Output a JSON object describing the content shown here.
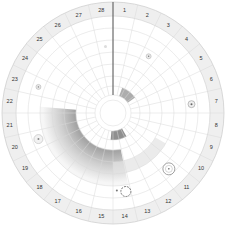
{
  "diagram": {
    "type": "circular-cycle-wheel",
    "segments": 28,
    "day_labels": [
      "1",
      "2",
      "3",
      "4",
      "5",
      "6",
      "7",
      "8",
      "9",
      "10",
      "11",
      "12",
      "13",
      "14",
      "15",
      "16",
      "17",
      "18",
      "19",
      "20",
      "21",
      "22",
      "23",
      "24",
      "25",
      "26",
      "27",
      "28"
    ],
    "needle_position": "between 28 and 1",
    "colors": {
      "label_ring": "#efefef",
      "grid": "#d8d8d8",
      "label_text": "#333333",
      "needle": "#444444",
      "shade_dark": "#6a6a6a",
      "shade_light": "#f4f4f4"
    },
    "markers": [
      {
        "day": 3,
        "ring": "middle",
        "style": "small-dot"
      },
      {
        "day": 7,
        "ring": "outer",
        "style": "ring-dot"
      },
      {
        "day": 11,
        "ring": "outer",
        "style": "large-ring"
      },
      {
        "day": 14,
        "ring": "outer",
        "style": "blob"
      },
      {
        "day": 20,
        "ring": "outer",
        "style": "flower"
      },
      {
        "day": 23,
        "ring": "outer",
        "style": "small-dot"
      },
      {
        "day": 28,
        "ring": "middle",
        "style": "faint-dot"
      }
    ]
  }
}
